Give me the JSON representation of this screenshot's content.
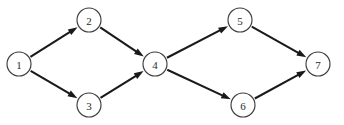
{
  "diagram": {
    "background_color": "#ffffff",
    "node_stroke_color": "#3d3d3d",
    "edge_color": "#1a1a1a",
    "label_color": "#2a2a2a",
    "node_radius": 12,
    "nodes": [
      {
        "id": "1",
        "label": "1",
        "cx": 19,
        "cy": 64
      },
      {
        "id": "2",
        "label": "2",
        "cx": 89,
        "cy": 20
      },
      {
        "id": "3",
        "label": "3",
        "cx": 89,
        "cy": 105
      },
      {
        "id": "4",
        "label": "4",
        "cx": 155,
        "cy": 64
      },
      {
        "id": "5",
        "label": "5",
        "cx": 240,
        "cy": 20
      },
      {
        "id": "6",
        "label": "6",
        "cx": 243,
        "cy": 105
      },
      {
        "id": "7",
        "label": "7",
        "cx": 318,
        "cy": 64
      }
    ],
    "edges": [
      {
        "id": "e1",
        "from": "1",
        "to": "2",
        "directed": true
      },
      {
        "id": "e2",
        "from": "1",
        "to": "3",
        "directed": true
      },
      {
        "id": "e3",
        "from": "2",
        "to": "4",
        "directed": true
      },
      {
        "id": "e4",
        "from": "3",
        "to": "4",
        "directed": true
      },
      {
        "id": "e5",
        "from": "4",
        "to": "5",
        "directed": true
      },
      {
        "id": "e6",
        "from": "4",
        "to": "6",
        "directed": true
      },
      {
        "id": "e7",
        "from": "5",
        "to": "7",
        "directed": true
      },
      {
        "id": "e8",
        "from": "6",
        "to": "7",
        "directed": true
      }
    ]
  }
}
